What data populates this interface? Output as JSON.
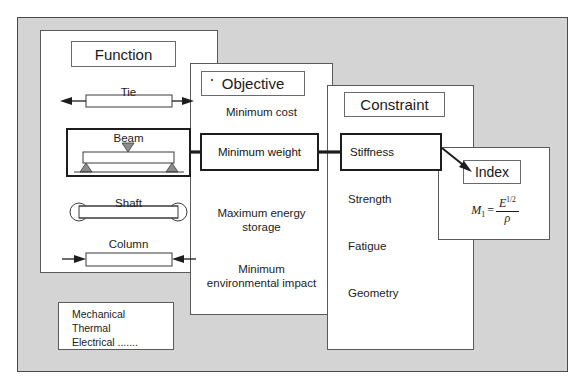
{
  "diagram": {
    "background_color": "#d4d4d4",
    "panel_color": "#ffffff",
    "line_color": "#1d1d1d"
  },
  "panels": {
    "function": {
      "title": "Function",
      "items": [
        {
          "label": "Tie",
          "icon": "tie-bar-tension-icon",
          "highlighted": false
        },
        {
          "label": "Beam",
          "icon": "beam-bending-icon",
          "highlighted": true
        },
        {
          "label": "Shaft",
          "icon": "shaft-torsion-icon",
          "highlighted": false
        },
        {
          "label": "Column",
          "icon": "column-compression-icon",
          "highlighted": false
        }
      ]
    },
    "objective": {
      "title": "Objective",
      "items": [
        {
          "label": "Minimum cost",
          "highlighted": false
        },
        {
          "label": "Minimum weight",
          "highlighted": true
        },
        {
          "label": "Maximum energy\nstorage",
          "highlighted": false
        },
        {
          "label": "Minimum\nenvironmental  impact",
          "highlighted": false
        }
      ]
    },
    "constraint": {
      "title": "Constraint",
      "items": [
        {
          "label": "Stiffness",
          "highlighted": true
        },
        {
          "label": "Strength",
          "highlighted": false
        },
        {
          "label": "Fatigue",
          "highlighted": false
        },
        {
          "label": "Geometry",
          "highlighted": false
        }
      ]
    },
    "index": {
      "title": "Index",
      "formula": {
        "lhs": "M",
        "lhs_subscript": "1",
        "equals": "=",
        "numerator": "E",
        "numerator_exponent": "1/2",
        "denominator": "ρ",
        "plain": "M1 = E^(1/2) / ρ"
      }
    }
  },
  "legend_box": {
    "lines": [
      "Mechanical",
      "Thermal",
      "Electrical ......."
    ]
  }
}
